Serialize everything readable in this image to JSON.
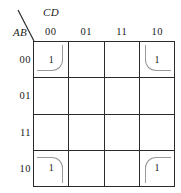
{
  "map": {
    "row_variable_label": "AB",
    "col_variable_label": "CD",
    "col_headers": [
      "00",
      "01",
      "11",
      "10"
    ],
    "row_headers": [
      "00",
      "01",
      "11",
      "10"
    ],
    "cells": [
      [
        {
          "value": "1",
          "group": "tl"
        },
        {
          "value": "",
          "group": ""
        },
        {
          "value": "",
          "group": ""
        },
        {
          "value": "1",
          "group": "tr"
        }
      ],
      [
        {
          "value": "",
          "group": ""
        },
        {
          "value": "",
          "group": ""
        },
        {
          "value": "",
          "group": ""
        },
        {
          "value": "",
          "group": ""
        }
      ],
      [
        {
          "value": "",
          "group": ""
        },
        {
          "value": "",
          "group": ""
        },
        {
          "value": "",
          "group": ""
        },
        {
          "value": "",
          "group": ""
        }
      ],
      [
        {
          "value": "1",
          "group": "bl"
        },
        {
          "value": "",
          "group": ""
        },
        {
          "value": "",
          "group": ""
        },
        {
          "value": "1",
          "group": "br"
        }
      ]
    ],
    "colors": {
      "grid_line": "#2b2b2b",
      "group_arc": "#9a9a9a",
      "text": "#1a1a1a",
      "background": "#ffffff"
    }
  }
}
